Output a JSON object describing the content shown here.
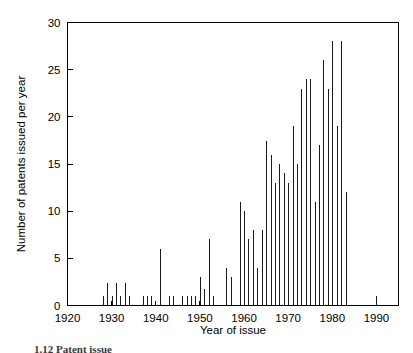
{
  "figure": {
    "caption_fragment": "1.12 Patent issue",
    "background_color": "#ffffff",
    "ink_color": "#000000"
  },
  "chart_data": {
    "type": "bar",
    "title": "",
    "subtitle": "",
    "xlabel": "Year of issue",
    "ylabel": "Number of patents issued per year",
    "xlim": [
      1920,
      1995
    ],
    "ylim": [
      0,
      30
    ],
    "xticks": [
      1920,
      1930,
      1940,
      1950,
      1960,
      1970,
      1980,
      1990
    ],
    "xtick_labels": [
      "1920",
      "1930",
      "1940",
      "1950",
      "1960",
      "1970",
      "1980",
      "1990"
    ],
    "yticks": [
      0,
      5,
      10,
      15,
      20,
      25,
      30
    ],
    "ytick_labels": [
      "0",
      "5",
      "10",
      "15",
      "20",
      "25",
      "30"
    ],
    "grid": false,
    "legend": false,
    "legend_position": "none",
    "bar_color": "#1a1a1a",
    "categories": [
      1928,
      1929,
      1930,
      1931,
      1932,
      1933,
      1934,
      1937,
      1938,
      1939,
      1941,
      1943,
      1944,
      1946,
      1947,
      1948,
      1949,
      1950,
      1951,
      1952,
      1953,
      1956,
      1957,
      1959,
      1960,
      1961,
      1962,
      1963,
      1964,
      1965,
      1966,
      1967,
      1968,
      1969,
      1970,
      1971,
      1972,
      1973,
      1974,
      1975,
      1976,
      1977,
      1978,
      1979,
      1980,
      1981,
      1982,
      1983,
      1990
    ],
    "values": [
      1,
      2.4,
      1,
      2.4,
      1,
      2.4,
      1,
      1,
      1,
      1,
      6,
      1,
      1,
      1,
      1,
      1,
      1,
      3,
      1.8,
      7,
      1,
      4,
      3,
      11,
      10,
      7,
      8,
      4,
      8,
      17.4,
      16,
      13,
      15,
      14,
      13,
      19,
      15,
      23,
      24,
      24,
      11,
      17,
      26,
      23,
      28,
      19,
      28,
      12,
      1
    ],
    "series": [
      {
        "name": "Patents issued per year",
        "points": [
          {
            "x": 1928,
            "y": 1
          },
          {
            "x": 1929,
            "y": 2.4
          },
          {
            "x": 1930,
            "y": 1
          },
          {
            "x": 1931,
            "y": 2.4
          },
          {
            "x": 1932,
            "y": 1
          },
          {
            "x": 1933,
            "y": 2.4
          },
          {
            "x": 1934,
            "y": 1
          },
          {
            "x": 1937,
            "y": 1
          },
          {
            "x": 1938,
            "y": 1
          },
          {
            "x": 1939,
            "y": 1
          },
          {
            "x": 1941,
            "y": 6
          },
          {
            "x": 1943,
            "y": 1
          },
          {
            "x": 1944,
            "y": 1
          },
          {
            "x": 1946,
            "y": 1
          },
          {
            "x": 1947,
            "y": 1
          },
          {
            "x": 1948,
            "y": 1
          },
          {
            "x": 1949,
            "y": 1
          },
          {
            "x": 1950,
            "y": 3
          },
          {
            "x": 1951,
            "y": 1.8
          },
          {
            "x": 1952,
            "y": 7
          },
          {
            "x": 1953,
            "y": 1
          },
          {
            "x": 1956,
            "y": 4
          },
          {
            "x": 1957,
            "y": 3
          },
          {
            "x": 1959,
            "y": 11
          },
          {
            "x": 1960,
            "y": 10
          },
          {
            "x": 1961,
            "y": 7
          },
          {
            "x": 1962,
            "y": 8
          },
          {
            "x": 1963,
            "y": 4
          },
          {
            "x": 1964,
            "y": 8
          },
          {
            "x": 1965,
            "y": 17.4
          },
          {
            "x": 1966,
            "y": 16
          },
          {
            "x": 1967,
            "y": 13
          },
          {
            "x": 1968,
            "y": 15
          },
          {
            "x": 1969,
            "y": 14
          },
          {
            "x": 1970,
            "y": 13
          },
          {
            "x": 1971,
            "y": 19
          },
          {
            "x": 1972,
            "y": 15
          },
          {
            "x": 1973,
            "y": 23
          },
          {
            "x": 1974,
            "y": 24
          },
          {
            "x": 1975,
            "y": 24
          },
          {
            "x": 1976,
            "y": 11
          },
          {
            "x": 1977,
            "y": 17
          },
          {
            "x": 1978,
            "y": 26
          },
          {
            "x": 1979,
            "y": 23
          },
          {
            "x": 1980,
            "y": 28
          },
          {
            "x": 1981,
            "y": 19
          },
          {
            "x": 1982,
            "y": 28
          },
          {
            "x": 1983,
            "y": 12
          },
          {
            "x": 1990,
            "y": 1
          }
        ]
      }
    ]
  }
}
